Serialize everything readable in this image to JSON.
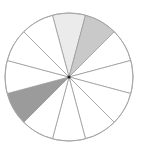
{
  "diagram": {
    "type": "sector-wheel",
    "center": {
      "x": 69,
      "y": 77
    },
    "radius": 64,
    "sector_count": 12,
    "start_angle_deg": -15,
    "stroke_color": "#9c9c9c",
    "outline_color": "#a8a8a8",
    "center_dot_color": "#222222",
    "default_fill": "#ffffff",
    "sectors": [
      {
        "index": 0,
        "fill": "#ebebeb",
        "label": "sector-1"
      },
      {
        "index": 1,
        "fill": "#c9c9c9",
        "label": "sector-2"
      },
      {
        "index": 2,
        "fill": "#ffffff",
        "label": "sector-3"
      },
      {
        "index": 3,
        "fill": "#ffffff",
        "label": "sector-4"
      },
      {
        "index": 4,
        "fill": "#ffffff",
        "label": "sector-5"
      },
      {
        "index": 5,
        "fill": "#ffffff",
        "label": "sector-6"
      },
      {
        "index": 6,
        "fill": "#ffffff",
        "label": "sector-7"
      },
      {
        "index": 7,
        "fill": "#ffffff",
        "label": "sector-8"
      },
      {
        "index": 8,
        "fill": "#9b9b9b",
        "label": "sector-9"
      },
      {
        "index": 9,
        "fill": "#ffffff",
        "label": "sector-10"
      },
      {
        "index": 10,
        "fill": "#ffffff",
        "label": "sector-11"
      },
      {
        "index": 11,
        "fill": "#ffffff",
        "label": "sector-12"
      }
    ]
  }
}
